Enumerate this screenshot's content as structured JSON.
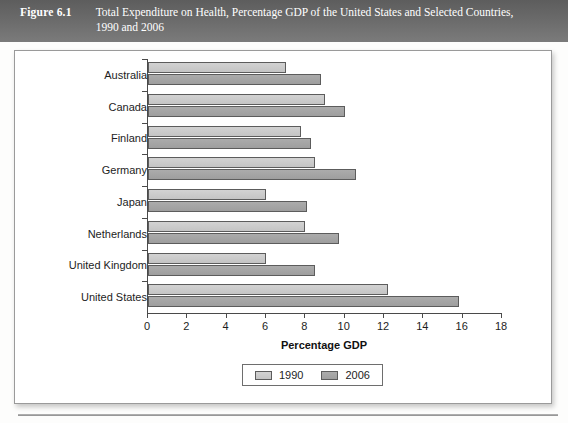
{
  "header": {
    "figure_label": "Figure 6.1",
    "title": "Total Expenditure on Health, Percentage GDP of the United States and Selected Countries, 1990 and 2006"
  },
  "colors": {
    "header_band": "#6a6a6a",
    "series_1990": "#c8c8c8",
    "series_2006": "#a0a0a0",
    "axis": "#4a4a4a",
    "plate_border": "#9a9a9a"
  },
  "chart_data": {
    "type": "bar",
    "orientation": "horizontal",
    "title": "Total Expenditure on Health, Percentage GDP of the United States and Selected Countries, 1990 and 2006",
    "xlabel": "Percentage GDP",
    "ylabel": "",
    "categories": [
      "Australia",
      "Canada",
      "Finland",
      "Germany",
      "Japan",
      "Netherlands",
      "United Kingdom",
      "United States"
    ],
    "series": [
      {
        "name": "1990",
        "color": "#c8c8c8",
        "values": [
          7.0,
          9.0,
          7.8,
          8.5,
          6.0,
          8.0,
          6.0,
          12.2
        ]
      },
      {
        "name": "2006",
        "color": "#a0a0a0",
        "values": [
          8.8,
          10.0,
          8.3,
          10.6,
          8.1,
          9.7,
          8.5,
          15.8
        ]
      }
    ],
    "xlim": [
      0,
      18
    ],
    "xticks": [
      0,
      2,
      4,
      6,
      8,
      10,
      12,
      14,
      16,
      18
    ],
    "xtick_labels": [
      "0",
      "2",
      "4",
      "6",
      "8",
      "10",
      "12",
      "14",
      "16",
      "18"
    ],
    "grid": false,
    "legend_position": "bottom",
    "legend_entries": [
      "1990",
      "2006"
    ]
  }
}
